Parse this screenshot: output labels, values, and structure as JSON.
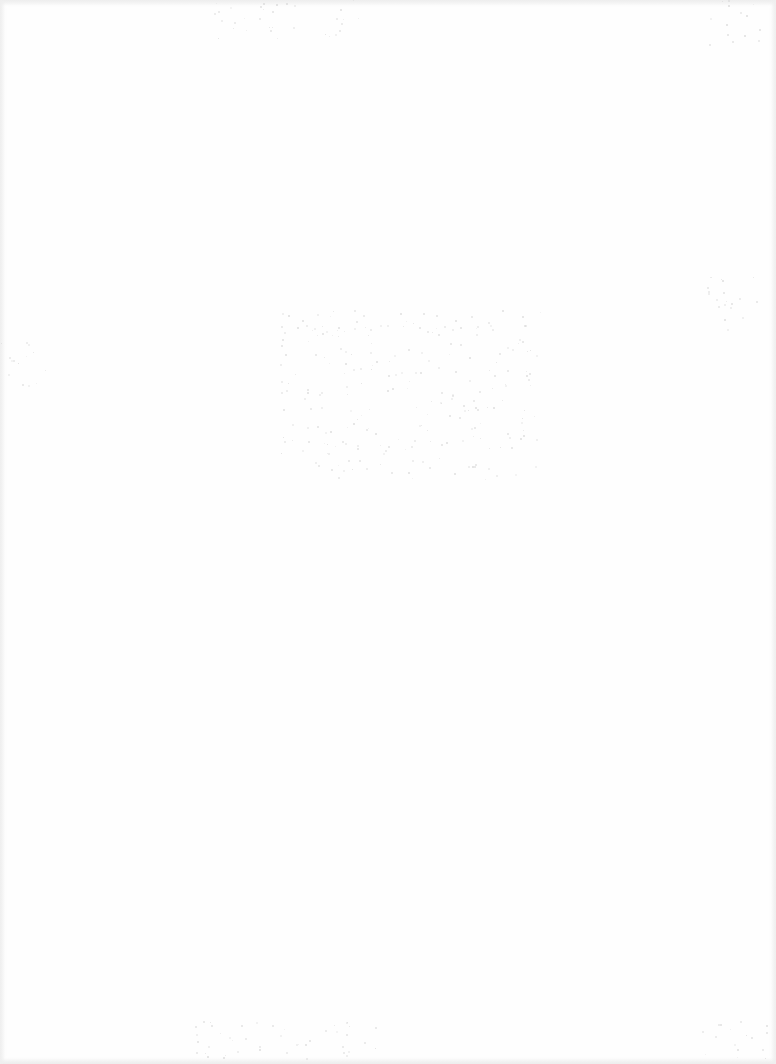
{
  "page": {
    "content_state": "blank",
    "text": "",
    "background_color": "#fefefe",
    "noise_color": "#d6d6d6"
  },
  "noise_regions": [
    {
      "name": "top-center",
      "x": 210,
      "y": 0,
      "w": 150,
      "h": 40
    },
    {
      "name": "top-right",
      "x": 705,
      "y": 0,
      "w": 55,
      "h": 45
    },
    {
      "name": "left-mid",
      "x": 0,
      "y": 340,
      "w": 50,
      "h": 50
    },
    {
      "name": "center-diagonal",
      "x": 280,
      "y": 310,
      "w": 260,
      "h": 170
    },
    {
      "name": "right-mid",
      "x": 700,
      "y": 270,
      "w": 60,
      "h": 60
    },
    {
      "name": "bottom-center",
      "x": 190,
      "y": 1020,
      "w": 200,
      "h": 40
    },
    {
      "name": "bottom-right",
      "x": 700,
      "y": 1020,
      "w": 70,
      "h": 40
    }
  ]
}
